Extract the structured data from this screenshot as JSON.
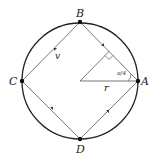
{
  "diagram": {
    "points": {
      "A": {
        "label": "A",
        "x": 138,
        "y": 81
      },
      "B": {
        "label": "B",
        "x": 80,
        "y": 22
      },
      "C": {
        "label": "C",
        "x": 22,
        "y": 81
      },
      "D": {
        "label": "D",
        "x": 80,
        "y": 139
      }
    },
    "center": {
      "x": 80,
      "y": 81
    },
    "radius_px": 58,
    "labels": {
      "velocity": "v",
      "radius": "r",
      "angle": "π/4"
    },
    "colors": {
      "circle": "#222222",
      "lines": "#444444",
      "text": "#222222"
    }
  }
}
